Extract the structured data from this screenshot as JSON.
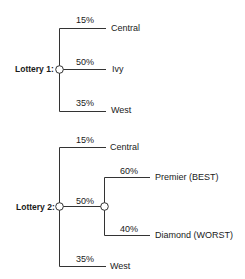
{
  "lottery1": {
    "label": "Lottery 1:",
    "branches": [
      {
        "prob": "15%",
        "outcome": "Central"
      },
      {
        "prob": "50%",
        "outcome": "Ivy"
      },
      {
        "prob": "35%",
        "outcome": "West"
      }
    ]
  },
  "lottery2": {
    "label": "Lottery 2:",
    "branches": [
      {
        "prob": "15%",
        "outcome": "Central"
      },
      {
        "prob": "50%",
        "sub_branches": [
          {
            "prob": "60%",
            "outcome": "Premier (BEST)"
          },
          {
            "prob": "40%",
            "outcome": "Diamond (WORST)"
          }
        ]
      },
      {
        "prob": "35%",
        "outcome": "West"
      }
    ]
  }
}
